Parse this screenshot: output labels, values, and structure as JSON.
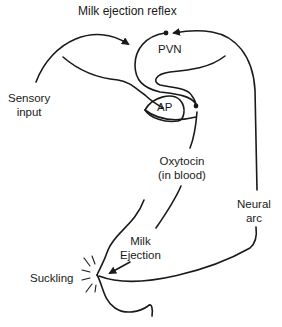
{
  "title": "Milk ejection reflex",
  "labels": {
    "pvn": "PVN",
    "ap": "AP",
    "sensory_line1": "Sensory",
    "sensory_line2": "input",
    "oxytocin_line1": "Oxytocin",
    "oxytocin_line2": "(in blood)",
    "neural_line1": "Neural",
    "neural_line2": "arc",
    "milk_line1": "Milk",
    "milk_line2": "Ejection",
    "suckling": "Suckling"
  },
  "colors": {
    "stroke": "#1a1a1a",
    "background": "#ffffff"
  }
}
